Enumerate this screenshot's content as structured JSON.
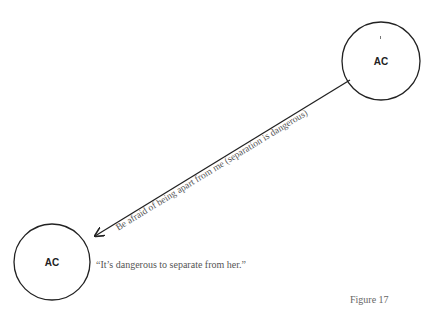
{
  "diagram": {
    "nodes": [
      {
        "id": "top-right",
        "label": "AC",
        "cx": 381,
        "cy": 61,
        "r": 39
      },
      {
        "id": "bottom-left",
        "label": "AC",
        "cx": 52,
        "cy": 262,
        "r": 38
      }
    ],
    "edge": {
      "from": "top-right",
      "to": "bottom-left",
      "label": "Be afraid of being apart from me (separation is dangerous)",
      "x1": 350,
      "y1": 80,
      "x2": 95,
      "y2": 236
    },
    "quote": "“It’s dangerous to separate from her.”",
    "caption": "Figure 17",
    "colors": {
      "stroke": "#222222",
      "text": "#555555"
    }
  }
}
